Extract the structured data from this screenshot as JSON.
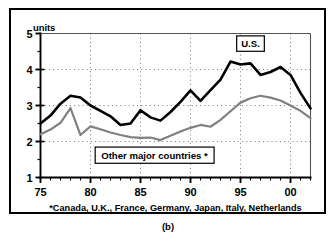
{
  "figure": {
    "caption": "(b)",
    "axis_unit_label": "units",
    "footnote": "*Canada, U.K., France, Germany, Japan, Italy, Netherlands",
    "us_label": "U.S.",
    "other_label": "Other major countries *"
  },
  "colors": {
    "us_line": "#000000",
    "other_line": "#808080",
    "grid": "#666666",
    "axis": "#000000",
    "frame": "#000000",
    "background": "#ffffff"
  },
  "chart_data": {
    "type": "line",
    "title": "",
    "subtitle": "",
    "xlabel": "",
    "ylabel": "units",
    "ylim": [
      1,
      5
    ],
    "xlim": [
      1975,
      2002
    ],
    "ytick_labels": [
      "1",
      "2",
      "3",
      "4",
      "5"
    ],
    "ytick_values": [
      1,
      2,
      3,
      4,
      5
    ],
    "yticks_minor_step": 0.5,
    "xtick_labels": [
      "75",
      "80",
      "85",
      "90",
      "95",
      "00"
    ],
    "xtick_values": [
      1975,
      1980,
      1985,
      1990,
      1995,
      2000
    ],
    "xticks_minor_step": 1,
    "grid": "dotted-both",
    "legend": "inline-annotations",
    "annotations": [
      {
        "text": "U.S.",
        "x": 1996,
        "y": 4.72,
        "boxed": true
      },
      {
        "text": "Other major countries *",
        "x": 1986.4,
        "y": 1.62,
        "boxed": true
      },
      {
        "text": "*Canada, U.K., France, Germany, Japan, Italy, Netherlands",
        "x": 1988.5,
        "y": 0.62,
        "boxed": false
      }
    ],
    "x": [
      1975,
      1976,
      1977,
      1978,
      1979,
      1980,
      1981,
      1982,
      1983,
      1984,
      1985,
      1986,
      1987,
      1988,
      1989,
      1990,
      1991,
      1992,
      1993,
      1994,
      1995,
      1996,
      1997,
      1998,
      1999,
      2000,
      2001,
      2002
    ],
    "series": [
      {
        "name": "U.S.",
        "color": "#000000",
        "width": 2.6,
        "values": [
          2.5,
          2.72,
          3.05,
          3.27,
          3.22,
          3.0,
          2.85,
          2.7,
          2.46,
          2.5,
          2.87,
          2.67,
          2.58,
          2.82,
          3.1,
          3.42,
          3.13,
          3.43,
          3.72,
          4.22,
          4.14,
          4.17,
          3.85,
          3.93,
          4.07,
          3.85,
          3.35,
          2.92
        ]
      },
      {
        "name": "Other major countries",
        "color": "#808080",
        "width": 2.2,
        "values": [
          2.2,
          2.33,
          2.52,
          2.93,
          2.18,
          2.42,
          2.34,
          2.25,
          2.18,
          2.12,
          2.1,
          2.11,
          2.04,
          2.16,
          2.28,
          2.38,
          2.46,
          2.41,
          2.6,
          2.84,
          3.08,
          3.2,
          3.27,
          3.22,
          3.14,
          3.0,
          2.85,
          2.65
        ]
      }
    ]
  }
}
